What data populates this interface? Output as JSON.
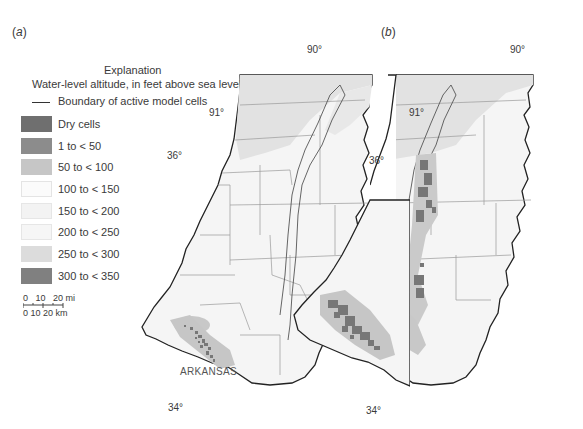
{
  "panels": [
    {
      "label_open": "(",
      "label_letter": "a",
      "label_close": ")"
    },
    {
      "label_open": "(",
      "label_letter": "b",
      "label_close": ")"
    }
  ],
  "legend": {
    "title": "Explanation",
    "subtitle": "Water-level altitude, in feet above sea level",
    "boundary_label": "Boundary of active model cells",
    "items": [
      {
        "label": "Dry cells",
        "color": "#6f6f6f"
      },
      {
        "label": "1 to < 50",
        "color": "#8c8c8c"
      },
      {
        "label": "50 to < 100",
        "color": "#c6c6c6"
      },
      {
        "label": "100 to < 150",
        "color": "#fbfbfb"
      },
      {
        "label": "150 to < 200",
        "color": "#f3f3f3"
      },
      {
        "label": "200 to < 250",
        "color": "#f6f6f6"
      },
      {
        "label": "250 to < 300",
        "color": "#dcdcdc"
      },
      {
        "label": "300 to < 350",
        "color": "#808080"
      }
    ]
  },
  "scale_bar": {
    "mi_labels": "0   10   20 mi",
    "km_labels": "0 10 20 km"
  },
  "coordinates": {
    "lon_90": "90°",
    "lon_91": "91°",
    "lat_36": "36°",
    "lat_34": "34°"
  },
  "state_label": "ARKANSAS"
}
